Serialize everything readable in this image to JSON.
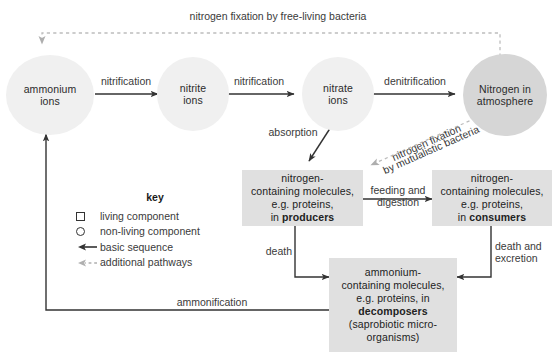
{
  "diagram": {
    "colors": {
      "circle_pale": "#f0f0f0",
      "circle_mid": "#d6d6d6",
      "box_fill": "#e0e0e0",
      "solid_arrow": "#333333",
      "dashed_arrow": "#b4b4b4",
      "text": "#2b2b2b"
    }
  },
  "nodes": {
    "ammonium_ions": "ammonium\nions",
    "ammonium_ions_l1": "ammonium",
    "ammonium_ions_l2": "ions",
    "nitrite_ions_l1": "nitrite",
    "nitrite_ions_l2": "ions",
    "nitrate_ions_l1": "nitrate",
    "nitrate_ions_l2": "ions",
    "nitrogen_atmosphere_l1": "Nitrogen in",
    "nitrogen_atmosphere_l2": "atmosphere",
    "producers_l1": "nitrogen-",
    "producers_l2": "containing molecules,",
    "producers_l3": "e.g. proteins,",
    "producers_l4_pre": "in ",
    "producers_l4_bold": "producers",
    "consumers_l1": "nitrogen-",
    "consumers_l2": "containing molecules,",
    "consumers_l3": "e.g. proteins,",
    "consumers_l4_pre": "in ",
    "consumers_l4_bold": "consumers",
    "decomposers_l1": "ammonium-",
    "decomposers_l2": "containing molecules,",
    "decomposers_l3": "e.g. proteins, in",
    "decomposers_l4_bold": "decomposers",
    "decomposers_l5": "(saprobiotic micro-",
    "decomposers_l6": "organisms)"
  },
  "edges": {
    "nitrogen_fixation_free_living": "nitrogen fixation by free-living bacteria",
    "nitrification_1": "nitrification",
    "nitrification_2": "nitrification",
    "denitrification": "denitrification",
    "absorption": "absorption",
    "nitrogen_fixation_mutualistic_l1": "nitrogen fixation",
    "nitrogen_fixation_mutualistic_l2": "by mutualistic bacteria",
    "feeding_l1": "feeding and",
    "feeding_l2": "digestion",
    "death": "death",
    "death_and_excretion_l1": "death and",
    "death_and_excretion_l2": "excretion",
    "ammonification": "ammonification"
  },
  "key": {
    "title": "key",
    "items": [
      {
        "symbol": "square-icon",
        "label": "living component"
      },
      {
        "symbol": "circle-icon",
        "label": "non-living component"
      },
      {
        "symbol": "solid-arrow-icon",
        "label": "basic sequence"
      },
      {
        "symbol": "dashed-arrow-icon",
        "label": "additional pathways"
      }
    ]
  }
}
